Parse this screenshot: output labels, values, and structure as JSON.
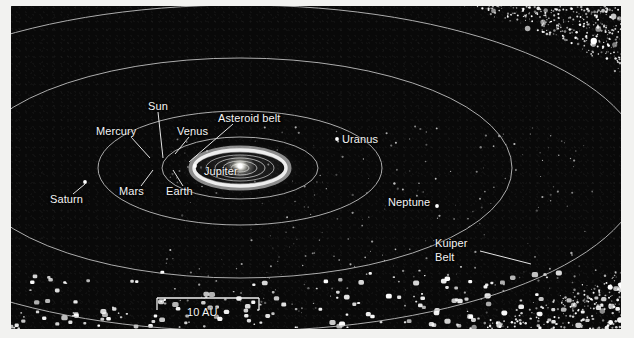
{
  "figure": {
    "background_color": "#0a0a0a",
    "margin_color": "#f2f2f0",
    "line_color": "#c8c8c8",
    "label_color": "#f4f4f4"
  },
  "labels": {
    "sun": "Sun",
    "mercury": "Mercury",
    "venus": "Venus",
    "asteroid_belt": "Asteroid belt",
    "mars": "Mars",
    "earth": "Earth",
    "jupiter": "Jupiter",
    "saturn": "Saturn",
    "uranus": "Uranus",
    "neptune": "Neptune",
    "kuiper_belt_line1": "Kuiper",
    "kuiper_belt_line2": "Belt"
  },
  "scale_bar": {
    "value": "10 AU"
  },
  "chart_data": {
    "type": "scatter",
    "projection": "oblique-perspective",
    "xlabel": "",
    "ylabel": "",
    "scale_bar_label": "10 AU",
    "scale_bar_length_au": 10,
    "center": {
      "x": 240,
      "y": 168
    },
    "orbits": [
      {
        "name": "Mercury",
        "rx": 7,
        "ry": 3,
        "drawn": true,
        "clipped": false
      },
      {
        "name": "Venus",
        "rx": 12,
        "ry": 5,
        "drawn": true,
        "clipped": false
      },
      {
        "name": "Earth",
        "rx": 17,
        "ry": 7,
        "drawn": true,
        "clipped": false
      },
      {
        "name": "Mars",
        "rx": 24,
        "ry": 10,
        "drawn": true,
        "clipped": false
      },
      {
        "name": "Jupiter",
        "rx": 78,
        "ry": 31,
        "drawn": true,
        "clipped": false
      },
      {
        "name": "Saturn",
        "rx": 142,
        "ry": 57,
        "drawn": true,
        "clipped": false
      },
      {
        "name": "Uranus",
        "rx": 272,
        "ry": 110,
        "drawn": true,
        "clipped": true
      },
      {
        "name": "Neptune",
        "rx": 404,
        "ry": 163,
        "drawn": true,
        "clipped": true
      }
    ],
    "planet_markers": [
      {
        "name": "Jupiter",
        "x": 195,
        "y": 166
      },
      {
        "name": "Saturn",
        "x": 85,
        "y": 182
      },
      {
        "name": "Uranus",
        "x": 337,
        "y": 139
      },
      {
        "name": "Neptune",
        "x": 437,
        "y": 206
      }
    ],
    "annotations": [
      {
        "text": "Sun",
        "x": 148,
        "y": 112,
        "leader_to": [
          154,
          155
        ]
      },
      {
        "text": "Mercury",
        "x": 96,
        "y": 133,
        "leader_to": [
          139,
          158
        ]
      },
      {
        "text": "Venus",
        "x": 176,
        "y": 133,
        "leader_to": [
          163,
          153
        ]
      },
      {
        "text": "Asteroid belt",
        "x": 214,
        "y": 118,
        "leader_to": [
          181,
          160
        ]
      },
      {
        "text": "Mars",
        "x": 116,
        "y": 185,
        "leader_to": [
          143,
          168
        ]
      },
      {
        "text": "Earth",
        "x": 164,
        "y": 185,
        "leader_to": [
          161,
          168
        ]
      },
      {
        "text": "Jupiter",
        "x": 201,
        "y": 170,
        "leader_to": null
      },
      {
        "text": "Saturn",
        "x": 50,
        "y": 192,
        "leader_to": [
          84,
          181
        ]
      },
      {
        "text": "Uranus",
        "x": 342,
        "y": 133,
        "leader_to": null
      },
      {
        "text": "Neptune",
        "x": 388,
        "y": 200,
        "leader_to": null
      },
      {
        "text": "Kuiper Belt",
        "x": 435,
        "y": 240,
        "leader_to": [
          520,
          258
        ]
      }
    ],
    "structures": [
      {
        "name": "asteroid belt glow",
        "description": "bright torus ring around the Sun",
        "rx": 48,
        "ry": 19
      },
      {
        "name": "Kuiper Belt",
        "description": "dense toroidal band of icy bodies surrounding the planetary orbits, densest along the upper-right and right side, with large scattered objects along the lower edge"
      }
    ],
    "legend": [],
    "grid": false
  }
}
